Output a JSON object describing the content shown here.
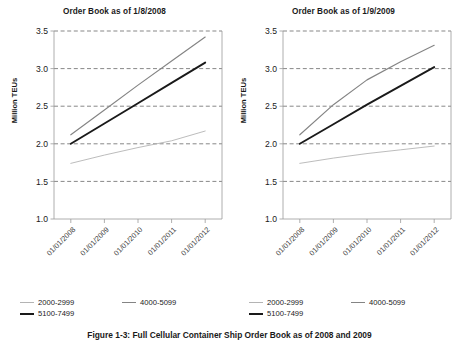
{
  "figure": {
    "caption": "Figure 1-3: Full Cellular Container Ship Order Book as of 2008 and 2009"
  },
  "colors": {
    "series_2000_2999": "#b4b4b4",
    "series_4000_5099": "#848484",
    "series_5100_7499": "#1a1a1a",
    "axis": "#9a9a9a",
    "grid": "#555555",
    "text": "#1a1a1a"
  },
  "legend": {
    "items": [
      {
        "label": "2000-2999",
        "color_key": "series_2000_2999"
      },
      {
        "label": "4000-5099",
        "color_key": "series_4000_5099"
      },
      {
        "label": "5100-7499",
        "color_key": "series_5100_7499"
      }
    ]
  },
  "panels": [
    {
      "title": "Order Book as of 1/8/2008",
      "ylabel": "Million TEUs"
    },
    {
      "title": "Order Book as of 1/9/2009",
      "ylabel": "Million TEUs"
    }
  ],
  "chart_data": [
    {
      "type": "line",
      "title": "Order Book as of 1/8/2008",
      "xlabel": "",
      "ylabel": "Million TEUs",
      "ylim": [
        1.0,
        3.5
      ],
      "yticks": [
        "1.0",
        "1.5",
        "2.0",
        "2.5",
        "3.0",
        "3.5"
      ],
      "ytick_values": [
        1.0,
        1.5,
        2.0,
        2.5,
        3.0,
        3.5
      ],
      "grid": true,
      "grid_style": "dashed-horizontal",
      "legend_position": "bottom-left",
      "categories": [
        "01/01/2008",
        "01/01/2009",
        "01/01/2010",
        "01/01/2011",
        "01/01/2012"
      ],
      "series": [
        {
          "name": "2000-2999",
          "values": [
            1.74,
            1.85,
            1.95,
            2.04,
            2.17
          ]
        },
        {
          "name": "4000-5099",
          "values": [
            2.12,
            2.45,
            2.78,
            3.1,
            3.42
          ]
        },
        {
          "name": "5100-7499",
          "values": [
            2.0,
            2.27,
            2.54,
            2.81,
            3.08
          ]
        }
      ]
    },
    {
      "type": "line",
      "title": "Order Book as of 1/9/2009",
      "xlabel": "",
      "ylabel": "Million TEUs",
      "ylim": [
        1.0,
        3.5
      ],
      "yticks": [
        "1.0",
        "1.5",
        "2.0",
        "2.5",
        "3.0",
        "3.5"
      ],
      "ytick_values": [
        1.0,
        1.5,
        2.0,
        2.5,
        3.0,
        3.5
      ],
      "grid": true,
      "grid_style": "dashed-horizontal",
      "legend_position": "bottom-left",
      "categories": [
        "01/01/2008",
        "01/01/2009",
        "01/01/2010",
        "01/01/2011",
        "01/01/2012"
      ],
      "series": [
        {
          "name": "2000-2999",
          "values": [
            1.74,
            1.81,
            1.87,
            1.92,
            1.97
          ]
        },
        {
          "name": "4000-5099",
          "values": [
            2.12,
            2.52,
            2.85,
            3.09,
            3.31
          ]
        },
        {
          "name": "5100-7499",
          "values": [
            2.0,
            2.26,
            2.52,
            2.77,
            3.02
          ]
        }
      ]
    }
  ]
}
